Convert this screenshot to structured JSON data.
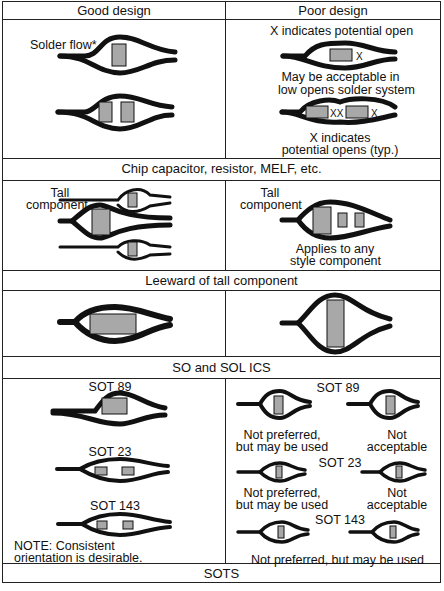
{
  "table": {
    "column_headers": [
      "Good design",
      "Poor design"
    ],
    "sections": [
      {
        "caption": "Chip capacitor, resistor, MELF, etc.",
        "good": {
          "labels": [
            "Solder flow*"
          ]
        },
        "poor": {
          "labels": [
            "X indicates potential open",
            "May be acceptable in",
            "low opens solder system",
            "X indicates",
            "potential opens (typ.)"
          ]
        }
      },
      {
        "caption": "Leeward of tall component",
        "good": {
          "labels": [
            "Tall",
            "component"
          ]
        },
        "poor": {
          "labels": [
            "Tall",
            "component",
            "Applies to any",
            "style component"
          ]
        }
      },
      {
        "caption": "SO and SOL ICS",
        "good": {
          "labels": []
        },
        "poor": {
          "labels": []
        }
      },
      {
        "caption": "SOTS",
        "good": {
          "labels": [
            "SOT 89",
            "SOT 23",
            "SOT 143",
            "NOTE: Consistent",
            "orientation is desirable."
          ]
        },
        "poor": {
          "labels": [
            "SOT 89",
            "Not preferred,",
            "but may be used",
            "Not",
            "acceptable",
            "SOT 23",
            "Not preferred,",
            "but may be used",
            "Not",
            "acceptable",
            "SOT 143",
            "Not preferred, but may be used"
          ]
        }
      }
    ]
  },
  "colors": {
    "ink": "#111111",
    "component_fill": "#a8a8a8",
    "background": "#ffffff"
  }
}
